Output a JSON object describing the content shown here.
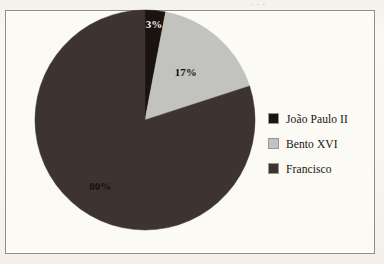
{
  "figure": {
    "background_color": "#faf8f3",
    "frame_color": "#8f8d86",
    "caption_cutoff": "· · ·"
  },
  "legend": {
    "position": "right",
    "items": [
      {
        "label": "João Paulo II",
        "color": "#1a1310",
        "swatch_name": "legend-swatch-joao-paulo-ii"
      },
      {
        "label": "Bento XVI",
        "color": "#c2c2be",
        "swatch_name": "legend-swatch-bento-xvi"
      },
      {
        "label": "Francisco",
        "color": "#3d3330",
        "swatch_name": "legend-swatch-francisco"
      }
    ]
  },
  "chart_data": {
    "type": "pie",
    "title": "",
    "xlabel": "",
    "ylabel": "",
    "legend_position": "right",
    "grid": false,
    "start_angle_deg": 0,
    "direction": "clockwise",
    "categories": [
      "João Paulo II",
      "Bento XVI",
      "Francisco"
    ],
    "values": [
      3,
      17,
      80
    ],
    "value_unit": "%",
    "colors": [
      "#1a1310",
      "#c2c2be",
      "#3d3330"
    ],
    "data_labels": [
      "3%",
      "17%",
      "80%"
    ],
    "data_label_colors": [
      "#f2efe8",
      "#16110e",
      "#15100d"
    ],
    "slices": [
      {
        "name": "João Paulo II",
        "value": 3,
        "label": "3%",
        "color": "#1a1310",
        "label_color": "#f2efe8"
      },
      {
        "name": "Bento XVI",
        "value": 17,
        "label": "17%",
        "color": "#c2c2be",
        "label_color": "#16110e"
      },
      {
        "name": "Francisco",
        "value": 80,
        "label": "80%",
        "color": "#3d3330",
        "label_color": "#15100d"
      }
    ]
  }
}
